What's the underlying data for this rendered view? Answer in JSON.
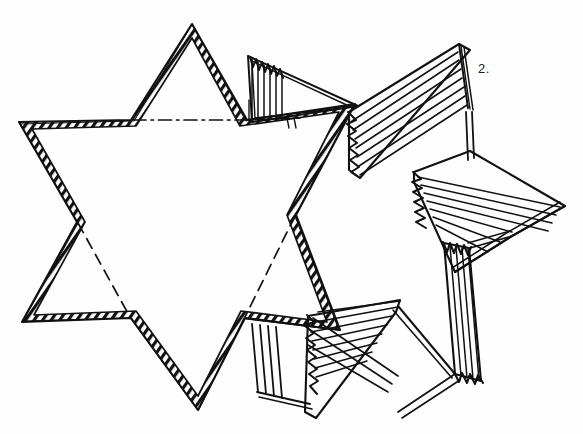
{
  "figure": {
    "label": "2.",
    "caption": "",
    "background_color": "#fefefe",
    "ink_color": "#111111",
    "width": 583,
    "height": 434
  },
  "geometry": {
    "star": {
      "name": "hexagram-outline",
      "style": "hatched-band",
      "outer_points": [
        {
          "name": "point-top",
          "x": 192,
          "y": 24
        },
        {
          "name": "point-upper-right",
          "x": 355,
          "y": 104
        },
        {
          "name": "point-lower-right",
          "x": 340,
          "y": 330
        },
        {
          "name": "point-bottom",
          "x": 198,
          "y": 410
        },
        {
          "name": "point-lower-left",
          "x": 22,
          "y": 322
        },
        {
          "name": "point-upper-left",
          "x": 19,
          "y": 122
        }
      ],
      "inner_points": [
        {
          "name": "notch-top-right",
          "x": 247,
          "y": 120
        },
        {
          "name": "notch-right",
          "x": 296,
          "y": 215
        },
        {
          "name": "notch-bottom-right",
          "x": 245,
          "y": 318
        },
        {
          "name": "notch-bottom-left",
          "x": 131,
          "y": 318
        },
        {
          "name": "notch-left",
          "x": 77,
          "y": 222
        },
        {
          "name": "notch-top-left",
          "x": 131,
          "y": 120
        }
      ]
    },
    "fold_lines": [
      {
        "name": "fold-line-top",
        "style": "dash-dot",
        "from": {
          "x": 131,
          "y": 120
        },
        "to": {
          "x": 247,
          "y": 120
        }
      },
      {
        "name": "fold-line-lower-left",
        "style": "dashed",
        "from": {
          "x": 77,
          "y": 222
        },
        "to": {
          "x": 131,
          "y": 318
        }
      },
      {
        "name": "fold-line-lower-right",
        "style": "dashed",
        "from": {
          "x": 296,
          "y": 215
        },
        "to": {
          "x": 245,
          "y": 318
        }
      }
    ],
    "motion_fans": [
      {
        "name": "fan-upper-wedge",
        "strokes": 6,
        "orientation": "vertical-comb",
        "anchor": {
          "x": 250,
          "y": 120
        },
        "tip": {
          "x": 252,
          "y": 55
        }
      },
      {
        "name": "fan-upper-right-arm",
        "strokes": 7,
        "orientation": "chevron",
        "anchor": {
          "x": 345,
          "y": 115
        },
        "tip": {
          "x": 458,
          "y": 44
        }
      },
      {
        "name": "fan-right-arm",
        "strokes": 7,
        "orientation": "chevron",
        "anchor": {
          "x": 455,
          "y": 165
        },
        "tip": {
          "x": 565,
          "y": 205
        }
      },
      {
        "name": "fan-right-vertical",
        "strokes": 6,
        "orientation": "vertical-comb",
        "anchor": {
          "x": 448,
          "y": 245
        },
        "tip": {
          "x": 462,
          "y": 375
        }
      },
      {
        "name": "fan-lower-right-arm",
        "strokes": 7,
        "orientation": "chevron",
        "anchor": {
          "x": 300,
          "y": 325
        },
        "tip": {
          "x": 395,
          "y": 410
        }
      },
      {
        "name": "fan-lower-comb",
        "strokes": 5,
        "orientation": "vertical-comb",
        "anchor": {
          "x": 260,
          "y": 330
        },
        "tip": {
          "x": 272,
          "y": 395
        }
      }
    ]
  }
}
